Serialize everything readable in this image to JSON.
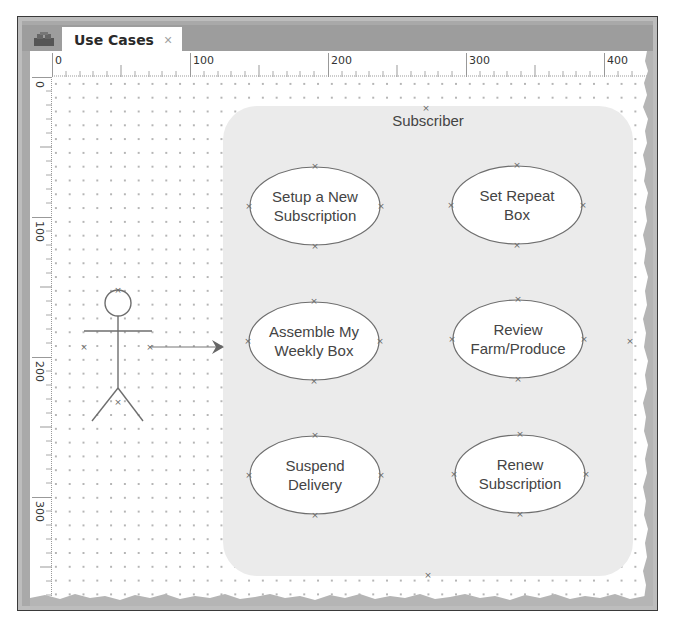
{
  "tab": {
    "label": "Use Cases",
    "close_icon": "×"
  },
  "app_icon": "diagram-app-icon",
  "rulers": {
    "horizontal": [
      "0",
      "100",
      "200",
      "300",
      "400"
    ],
    "vertical": [
      "0",
      "100",
      "200",
      "300"
    ]
  },
  "diagram": {
    "actor": {
      "name": "",
      "icon": "stick-figure-actor"
    },
    "association": {
      "from": "actor",
      "to": "Assemble My Weekly Box",
      "arrow": "open-arrow"
    },
    "system_boundary": {
      "title": "Subscriber"
    },
    "use_cases": [
      {
        "label": "Setup a New\nSubscription"
      },
      {
        "label": "Set Repeat\nBox"
      },
      {
        "label": "Assemble My\nWeekly Box"
      },
      {
        "label": "Review\nFarm/Produce"
      },
      {
        "label": "Suspend\nDelivery"
      },
      {
        "label": "Renew\nSubscription"
      }
    ]
  },
  "colors": {
    "frame": "#a9a9a9",
    "tabbar": "#9d9d9d",
    "boundary_fill": "#ebebeb",
    "line": "#6e6e6e",
    "text": "#444444"
  }
}
